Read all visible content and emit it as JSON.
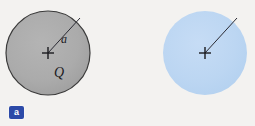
{
  "figure": {
    "background_color": "#f3f2f0",
    "panels": [
      {
        "key": "a",
        "badge_label": "a",
        "badge_color": "#2c4aa8",
        "badge_text_color": "#ffffff",
        "sphere": {
          "name": "conducting-sphere",
          "fill_color": "#a9a9a9",
          "stroke_color": "#3a3a3a",
          "stroke_width": 1.2,
          "center_x": 44,
          "center_y": 53,
          "radius": 42
        },
        "center_mark": "plus-cross",
        "radius_line": {
          "from": [
            44,
            53
          ],
          "to": [
            76,
            18
          ],
          "stroke_color": "#2a2a33"
        },
        "radius_label": "a",
        "charge_label": "Q"
      },
      {
        "key": "b",
        "badge_label": "b",
        "badge_color": "#2c4aa8",
        "badge_text_color": "#ffffff",
        "sphere": {
          "name": "insulating-sphere",
          "fill_color": "#bdd7f2",
          "stroke_color": "none",
          "stroke_width": 0,
          "center_x": 205,
          "center_y": 53,
          "radius": 42
        },
        "center_mark": "plus-cross",
        "radius_line": {
          "from": [
            205,
            53
          ],
          "to": [
            237,
            18
          ],
          "stroke_color": "#2a2a33"
        },
        "radius_label": "a",
        "charge_label": "Q"
      }
    ]
  }
}
